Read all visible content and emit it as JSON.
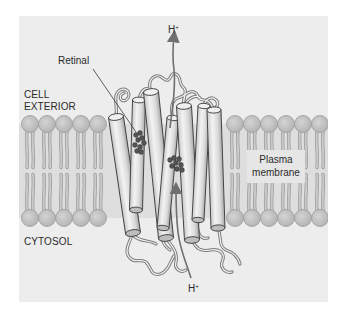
{
  "figure": {
    "labels": {
      "retinal": "Retinal",
      "cell_exterior_line1": "CELL",
      "cell_exterior_line2": "EXTERIOR",
      "cytosol": "CYTOSOL",
      "plasma_membrane_line1": "Plasma",
      "plasma_membrane_line2": "membrane",
      "proton_top": "H",
      "proton_top_charge": "+",
      "proton_bottom": "H",
      "proton_bottom_charge": "+"
    },
    "colors": {
      "panel_background": "#ededed",
      "lipid_head": "#bdbdbd",
      "lipid_tail": "#c9c9c9",
      "helix_fill": "#e2e2e2",
      "helix_stroke": "#3a3a3a",
      "loop_stroke": "#7a7a7a",
      "retinal_dots": "#555555",
      "arrow": "#6f6f6f",
      "text": "#2a2a2a"
    },
    "membrane": {
      "outer_head_y": 124,
      "inner_head_y": 218,
      "head_radius": 8.5,
      "left_heads_x": [
        30,
        47,
        64,
        81,
        98
      ],
      "right_heads_x": [
        235,
        252,
        269,
        286,
        303,
        320
      ]
    },
    "helices": [
      {
        "id": "A",
        "x1": 116,
        "y1": 117,
        "x2": 133,
        "y2": 233,
        "w": 15
      },
      {
        "id": "B",
        "x1": 139,
        "y1": 100,
        "x2": 136,
        "y2": 210,
        "w": 13
      },
      {
        "id": "C",
        "x1": 151,
        "y1": 92,
        "x2": 166,
        "y2": 238,
        "w": 15
      },
      {
        "id": "D",
        "x1": 173,
        "y1": 118,
        "x2": 163,
        "y2": 228,
        "w": 12
      },
      {
        "id": "E",
        "x1": 184,
        "y1": 106,
        "x2": 192,
        "y2": 240,
        "w": 15
      },
      {
        "id": "F",
        "x1": 204,
        "y1": 106,
        "x2": 198,
        "y2": 220,
        "w": 12
      },
      {
        "id": "G",
        "x1": 214,
        "y1": 110,
        "x2": 218,
        "y2": 228,
        "w": 14
      }
    ],
    "retinal_dots": [
      [
        136,
        135
      ],
      [
        140,
        133
      ],
      [
        138,
        140
      ],
      [
        142,
        138
      ],
      [
        135,
        145
      ],
      [
        140,
        147
      ],
      [
        144,
        143
      ],
      [
        137,
        151
      ],
      [
        141,
        152
      ],
      [
        170,
        160
      ],
      [
        174,
        158
      ],
      [
        176,
        163
      ],
      [
        179,
        159
      ],
      [
        181,
        165
      ],
      [
        172,
        166
      ],
      [
        177,
        169
      ],
      [
        182,
        170
      ]
    ]
  }
}
